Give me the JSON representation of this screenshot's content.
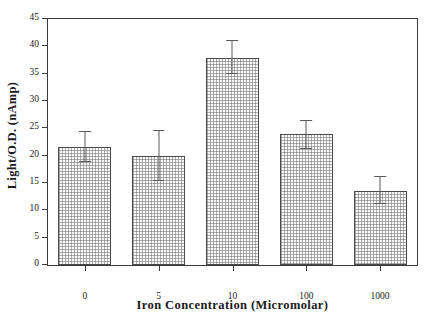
{
  "chart_data": {
    "type": "bar",
    "title": "",
    "xlabel": "Iron Concentration  (Micromolar)",
    "ylabel": "Light/O.D.  (nAmp)",
    "categories": [
      "0",
      "5",
      "10",
      "100",
      "1000"
    ],
    "values": [
      21.6,
      19.9,
      37.8,
      23.9,
      13.6
    ],
    "errors_upper": [
      24.4,
      24.5,
      41.0,
      26.3,
      16.1
    ],
    "errors_lower": [
      18.8,
      15.3,
      34.9,
      21.2,
      11.2
    ],
    "ylim": [
      0,
      45
    ],
    "yticks": [
      0,
      5,
      10,
      15,
      20,
      25,
      30,
      35,
      40,
      45
    ],
    "ytick_labels": [
      "0",
      "5",
      "10",
      "15",
      "20",
      "25",
      "30",
      "35",
      "40",
      "45"
    ],
    "grid": false,
    "legend": null,
    "bar_fill": "#fbfbfb",
    "bar_edge": "#4a4a4a",
    "error_color": "#5a5a5a",
    "axis_color": "#3b3b3b",
    "text_color": "#1a1a1a"
  }
}
